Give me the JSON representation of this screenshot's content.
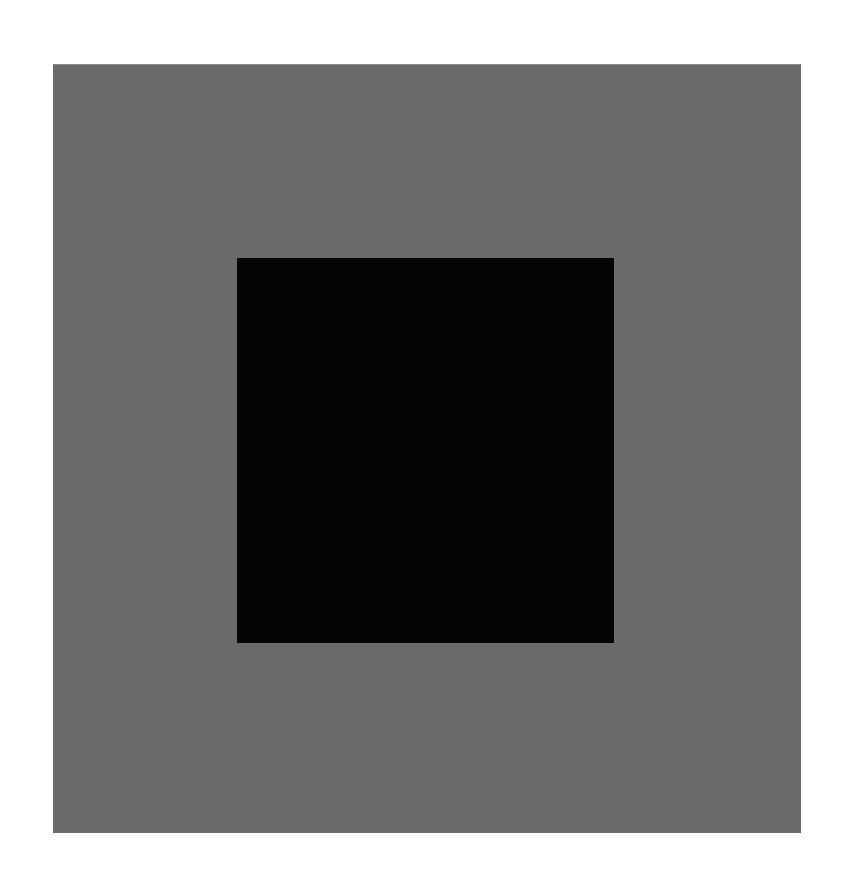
{
  "canvas": {
    "width": 853,
    "height": 884,
    "background_color": "#ffffff"
  },
  "shapes": [
    {
      "name": "outer-gray-square",
      "color": "#6b6b6b",
      "x": 53,
      "y": 64,
      "width": 748,
      "height": 769
    },
    {
      "name": "inner-black-square",
      "color": "#050505",
      "x": 237,
      "y": 258,
      "width": 377,
      "height": 385
    }
  ]
}
